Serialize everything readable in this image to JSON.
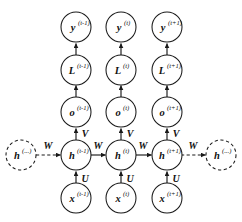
{
  "diagram": {
    "background_color": "#ffffff",
    "stroke_color": "#1a1a1a",
    "columns": [
      {
        "key": "prev",
        "time_index": "(t-1)"
      },
      {
        "key": "curr",
        "time_index": "(t)"
      },
      {
        "key": "next",
        "time_index": "(t+1)"
      }
    ],
    "rows": [
      {
        "key": "y",
        "symbol": "y"
      },
      {
        "key": "L",
        "symbol": "L"
      },
      {
        "key": "o",
        "symbol": "o"
      },
      {
        "key": "h",
        "symbol": "h"
      },
      {
        "key": "x",
        "symbol": "x"
      }
    ],
    "nodes": {
      "y_prev": {
        "symbol": "y",
        "sup": "(t-1)",
        "style": "solid"
      },
      "y_curr": {
        "symbol": "y",
        "sup": "(t)",
        "style": "solid"
      },
      "y_next": {
        "symbol": "y",
        "sup": "(t+1)",
        "style": "solid"
      },
      "L_prev": {
        "symbol": "L",
        "sup": "(t-1)",
        "style": "solid"
      },
      "L_curr": {
        "symbol": "L",
        "sup": "(t)",
        "style": "solid"
      },
      "L_next": {
        "symbol": "L",
        "sup": "(t+1)",
        "style": "solid"
      },
      "o_prev": {
        "symbol": "o",
        "sup": "(t-1)",
        "style": "solid"
      },
      "o_curr": {
        "symbol": "o",
        "sup": "(t)",
        "style": "solid"
      },
      "o_next": {
        "symbol": "o",
        "sup": "(t+1)",
        "style": "solid"
      },
      "h_left_ellipsis": {
        "symbol": "h",
        "sup": "(...)",
        "style": "dashed"
      },
      "h_prev": {
        "symbol": "h",
        "sup": "(t-1)",
        "style": "solid"
      },
      "h_curr": {
        "symbol": "h",
        "sup": "(t)",
        "style": "solid"
      },
      "h_next": {
        "symbol": "h",
        "sup": "(t+1)",
        "style": "solid"
      },
      "h_right_ellipsis": {
        "symbol": "h",
        "sup": "(...)",
        "style": "dashed"
      },
      "x_prev": {
        "symbol": "x",
        "sup": "(t-1)",
        "style": "solid"
      },
      "x_curr": {
        "symbol": "x",
        "sup": "(t)",
        "style": "solid"
      },
      "x_next": {
        "symbol": "x",
        "sup": "(t+1)",
        "style": "solid"
      }
    },
    "weights": {
      "V_prev": "V",
      "V_curr": "V",
      "V_next": "V",
      "U_prev": "U",
      "U_curr": "U",
      "U_next": "U",
      "W_in": "W",
      "W_prev_curr": "W",
      "W_curr_next": "W",
      "W_out": "W"
    }
  }
}
